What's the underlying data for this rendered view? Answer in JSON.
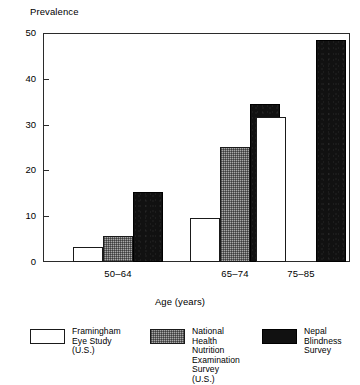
{
  "chart_data": {
    "type": "bar",
    "title": "",
    "ylabel": "Prevalence",
    "xlabel": "Age (years)",
    "categories": [
      "50–64",
      "65–74",
      "75–85"
    ],
    "ylim": [
      0,
      50
    ],
    "yticks": [
      0,
      10,
      20,
      30,
      40,
      50
    ],
    "ytick_labels": [
      "0",
      "10",
      "20",
      "30",
      "40",
      "50"
    ],
    "grid": false,
    "legend_position": "bottom",
    "series": [
      {
        "name": "Framingham\nEye Study (U.S.)",
        "fill": "white",
        "values": [
          3.2,
          9.6,
          31.7
        ]
      },
      {
        "name": "National Health\nNutrition\nExamination\nSurvey (U.S.)",
        "fill": "gray-hatch",
        "values": [
          5.6,
          25.1,
          null
        ]
      },
      {
        "name": "Nepal\nBlindness\nSurvey",
        "fill": "black",
        "values": [
          15.2,
          34.6,
          48.5
        ]
      }
    ]
  },
  "axis": {
    "y_title": "Prevalence",
    "x_title": "Age (years)",
    "ytick_labels": [
      "0",
      "10",
      "20",
      "30",
      "40",
      "50"
    ],
    "xtick_labels": [
      "50–64",
      "65–74",
      "75–85"
    ]
  },
  "legend": {
    "items": [
      {
        "label": "Framingham\nEye Study (U.S.)",
        "swatch": "white"
      },
      {
        "label": "National Health\nNutrition\nExamination\nSurvey (U.S.)",
        "swatch": "gray"
      },
      {
        "label": "Nepal\nBlindness\nSurvey",
        "swatch": "black"
      }
    ]
  },
  "colors": {
    "axis": "#2b2b2b",
    "bar_white": "#ffffff",
    "bar_gray": "#a8a8a8",
    "bar_black": "#111111",
    "background": "#ffffff"
  }
}
